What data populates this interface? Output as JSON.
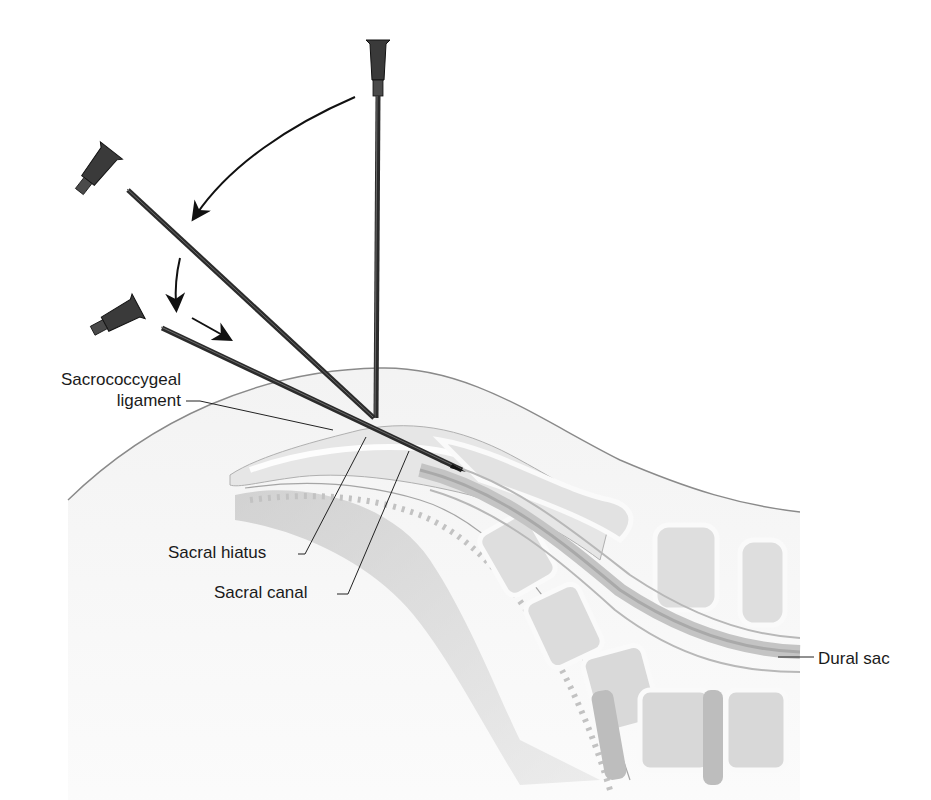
{
  "figure": {
    "needle_positions": [
      "vertical-start",
      "angled-intermediate",
      "shallow-advanced"
    ],
    "motion_arrows": [
      "rotate-down-arc",
      "lower-angle",
      "advance-into-canal"
    ]
  },
  "labels": {
    "sacrococcygeal_line1": "Sacrococcygeal",
    "sacrococcygeal_line2": "ligament",
    "sacral_hiatus": "Sacral hiatus",
    "sacral_canal": "Sacral canal",
    "dural_sac": "Dural sac"
  },
  "colors": {
    "needle": "#2b2b2b",
    "hub": "#3a3a3a",
    "skin": "#ececec",
    "bone": "#f7f7f7",
    "bone_fill": "#dcdcdc",
    "dura": "#bdbdbd",
    "leader": "#222222"
  }
}
